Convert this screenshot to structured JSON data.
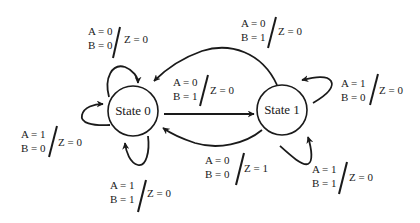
{
  "diagram": {
    "type": "finite-state-machine",
    "colors": {
      "stroke": "#1a1a1a",
      "background": "#ffffff"
    },
    "states": [
      {
        "id": "s0",
        "label": "State 0",
        "cx": 133,
        "cy": 111,
        "r": 25
      },
      {
        "id": "s1",
        "label": "State 1",
        "cx": 282,
        "cy": 110,
        "r": 25
      }
    ],
    "transitions": [
      {
        "id": "t-s0-self-top",
        "from": "State 0",
        "to": "State 0",
        "a": "A = 0",
        "b": "B = 0",
        "z": "Z = 0",
        "label_pos": {
          "x": 88,
          "y": 35,
          "zx": 124,
          "slash": [
            120,
            27,
            113,
            58
          ]
        }
      },
      {
        "id": "t-s0-self-left",
        "from": "State 0",
        "to": "State 0",
        "a": "A = 1",
        "b": "B = 0",
        "z": "Z = 0",
        "label_pos": {
          "x": 21,
          "y": 138,
          "zx": 58,
          "slash": [
            57,
            126,
            49,
            157
          ]
        }
      },
      {
        "id": "t-s0-self-bottom",
        "from": "State 0",
        "to": "State 0",
        "a": "A = 1",
        "b": "B = 1",
        "z": "Z = 0",
        "label_pos": {
          "x": 110,
          "y": 189,
          "zx": 147,
          "slash": [
            146,
            180,
            138,
            212
          ]
        }
      },
      {
        "id": "t-s0-to-s1",
        "from": "State 0",
        "to": "State 1",
        "a": "A = 0",
        "b": "B = 1",
        "z": "Z = 0",
        "label_pos": {
          "x": 173,
          "y": 86,
          "zx": 210,
          "slash": [
            208,
            75,
            200,
            106
          ]
        }
      },
      {
        "id": "t-s1-to-s0-top",
        "from": "State 1",
        "to": "State 0",
        "a": "A = 0",
        "b": "B = 1",
        "z": "Z = 0",
        "label_pos": {
          "x": 241,
          "y": 27,
          "zx": 278,
          "slash": [
            276,
            17,
            268,
            48
          ]
        }
      },
      {
        "id": "t-s1-to-s0-bottom",
        "from": "State 1",
        "to": "State 0",
        "a": "A = 0",
        "b": "B = 0",
        "z": "Z = 1",
        "label_pos": {
          "x": 203,
          "y": 164,
          "zx": 243,
          "slash": [
            244,
            153,
            236,
            185
          ]
        }
      },
      {
        "id": "t-s1-self-right",
        "from": "State 1",
        "to": "State 1",
        "a": "A = 1",
        "b": "B = 0",
        "z": "Z = 0",
        "label_pos": {
          "x": 341,
          "y": 87,
          "zx": 378,
          "slash": [
            378,
            74,
            370,
            105
          ]
        }
      },
      {
        "id": "t-s1-self-bottom",
        "from": "State 1",
        "to": "State 1",
        "a": "A = 1",
        "b": "B = 1",
        "z": "Z = 0",
        "label_pos": {
          "x": 312,
          "y": 173,
          "zx": 348,
          "slash": [
            347,
            162,
            339,
            194
          ]
        }
      }
    ]
  }
}
